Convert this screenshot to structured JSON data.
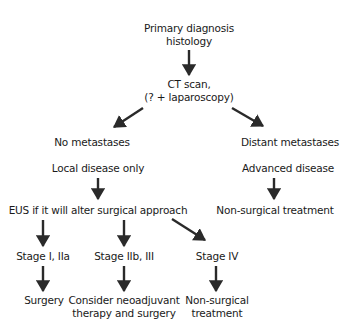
{
  "diagram": {
    "type": "flowchart",
    "nodes": {
      "primary": {
        "lines": [
          "Primary diagnosis",
          "histology"
        ]
      },
      "ct_scan": {
        "lines": [
          "CT scan,",
          "(? + laparoscopy)"
        ]
      },
      "no_mets": {
        "lines": [
          "No metastases"
        ]
      },
      "distant_mets": {
        "lines": [
          "Distant metastases"
        ]
      },
      "local_disease": {
        "lines": [
          "Local disease only"
        ]
      },
      "advanced_disease": {
        "lines": [
          "Advanced disease"
        ]
      },
      "eus": {
        "lines": [
          "EUS if it will alter surgical approach"
        ]
      },
      "non_surgical_right": {
        "lines": [
          "Non-surgical treatment"
        ]
      },
      "stage_1_2a": {
        "lines": [
          "Stage I, IIa"
        ]
      },
      "stage_2b_3": {
        "lines": [
          "Stage IIb, III"
        ]
      },
      "stage_4": {
        "lines": [
          "Stage IV"
        ]
      },
      "surgery": {
        "lines": [
          "Surgery"
        ]
      },
      "neoadjuvant": {
        "lines": [
          "Consider neoadjuvant",
          "therapy and surgery"
        ]
      },
      "non_surgical_bottom": {
        "lines": [
          "Non-surgical",
          "treatment"
        ]
      }
    },
    "edges": [
      {
        "from": "primary",
        "to": "ct_scan"
      },
      {
        "from": "ct_scan",
        "to": "no_mets"
      },
      {
        "from": "ct_scan",
        "to": "distant_mets"
      },
      {
        "from": "local_disease",
        "to": "eus"
      },
      {
        "from": "advanced_disease",
        "to": "non_surgical_right"
      },
      {
        "from": "eus",
        "to": "stage_1_2a"
      },
      {
        "from": "eus",
        "to": "stage_2b_3"
      },
      {
        "from": "eus",
        "to": "stage_4"
      },
      {
        "from": "stage_1_2a",
        "to": "surgery"
      },
      {
        "from": "stage_2b_3",
        "to": "neoadjuvant"
      },
      {
        "from": "stage_4",
        "to": "non_surgical_bottom"
      }
    ],
    "colors": {
      "background": "#ffffff",
      "text": "#1a1a1a",
      "arrow": "#2a2a2a"
    }
  }
}
